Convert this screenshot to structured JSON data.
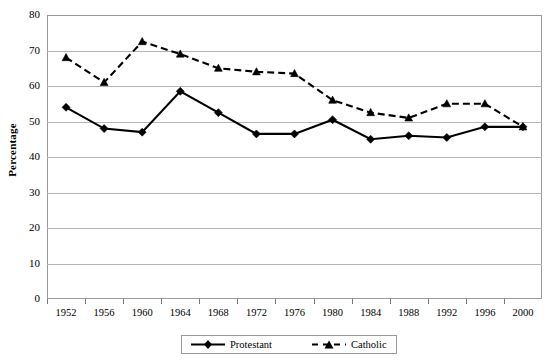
{
  "chart_data": {
    "type": "line",
    "title": "",
    "xlabel": "",
    "ylabel": "Percentage",
    "ylim": [
      0,
      80
    ],
    "ytick_step": 10,
    "yticks": [
      80,
      70,
      60,
      50,
      40,
      30,
      20,
      10,
      0
    ],
    "grid": true,
    "legend_position": "bottom",
    "categories": [
      "1952",
      "1956",
      "1960",
      "1964",
      "1968",
      "1972",
      "1976",
      "1980",
      "1984",
      "1988",
      "1992",
      "1996",
      "2000"
    ],
    "series": [
      {
        "name": "Protestant",
        "style": "solid",
        "marker": "diamond",
        "color": "#000000",
        "values": [
          54,
          48,
          47,
          58.5,
          52.5,
          46.5,
          46.5,
          50.5,
          45,
          46,
          45.5,
          48.5,
          48.5
        ]
      },
      {
        "name": "Catholic",
        "style": "dashed",
        "marker": "triangle",
        "color": "#000000",
        "values": [
          68,
          61,
          72.5,
          69,
          65,
          64,
          63.5,
          56,
          52.5,
          51,
          55,
          55,
          48.5
        ]
      }
    ]
  },
  "legend": {
    "entries": [
      {
        "label": "Protestant"
      },
      {
        "label": "Catholic"
      }
    ]
  },
  "colors": {
    "plot_background": "#ffffff",
    "gridline": "#b5b5b5",
    "frame": "#9a9a9a",
    "series": "#000000"
  }
}
